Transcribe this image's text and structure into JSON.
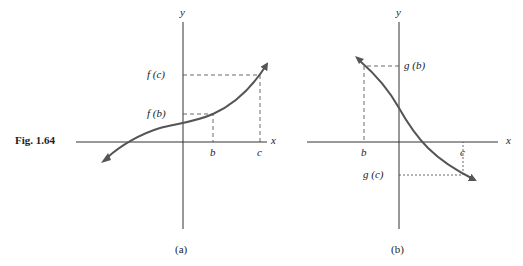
{
  "figure": {
    "label": "Fig. 1.64",
    "panels": [
      {
        "caption": "(a)",
        "axis_x": "x",
        "axis_y": "y",
        "tick_x": [
          "b",
          "c"
        ],
        "tick_y": [
          "f (b)",
          "f (c)"
        ],
        "description": "increasing function f"
      },
      {
        "caption": "(b)",
        "axis_x": "x",
        "axis_y": "y",
        "tick_x": [
          "b",
          "c"
        ],
        "tick_y": [
          "g (b)",
          "g (c)"
        ],
        "description": "decreasing function g"
      }
    ]
  },
  "colors": {
    "axis": "#333333",
    "curve": "#555555",
    "dashed": "#444444"
  }
}
